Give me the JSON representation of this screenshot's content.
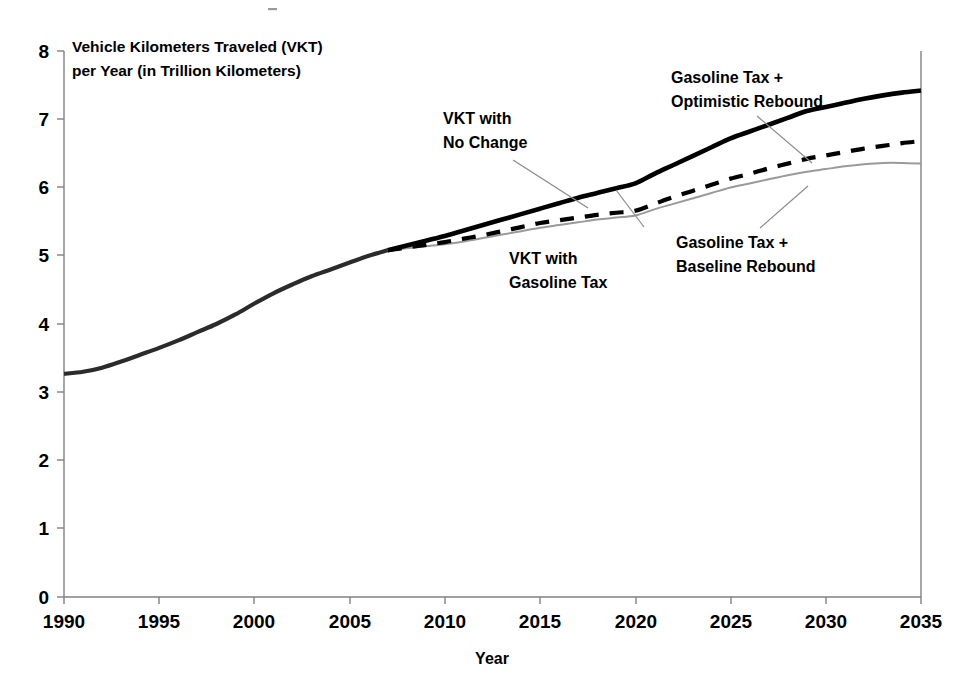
{
  "chart_data": {
    "type": "line",
    "title": "",
    "xlabel": "Year",
    "ylabel": "Vehicle Kilometers Traveled (VKT) per Year (in Trillion Kilometers)",
    "ylabel_line1": "Vehicle Kilometers Traveled (VKT)",
    "ylabel_line2": "per Year (in Trillion Kilometers)",
    "xlim": [
      1990,
      2035
    ],
    "ylim": [
      0,
      8
    ],
    "xticks": [
      1990,
      1995,
      2000,
      2005,
      2010,
      2015,
      2020,
      2025,
      2030,
      2035
    ],
    "yticks": [
      0,
      1,
      2,
      3,
      4,
      5,
      6,
      7,
      8
    ],
    "grid": false,
    "legend_position": "annotations-inline",
    "x": [
      1990,
      1991,
      1992,
      1993,
      1994,
      1995,
      1996,
      1997,
      1998,
      1999,
      2000,
      2001,
      2002,
      2003,
      2004,
      2005,
      2006,
      2007,
      2008,
      2009,
      2010,
      2011,
      2012,
      2013,
      2014,
      2015,
      2016,
      2017,
      2018,
      2019,
      2020,
      2021,
      2022,
      2023,
      2024,
      2025,
      2026,
      2027,
      2028,
      2029,
      2030,
      2031,
      2032,
      2033,
      2034,
      2035
    ],
    "series": [
      {
        "name": "VKT with No Change",
        "style": "solid-thick-black",
        "color": "#000000",
        "values": [
          3.27,
          3.3,
          3.36,
          3.45,
          3.55,
          3.65,
          3.76,
          3.88,
          4.0,
          4.14,
          4.3,
          4.45,
          4.58,
          4.7,
          4.8,
          4.9,
          5.0,
          5.08,
          5.15,
          5.22,
          5.29,
          5.37,
          5.45,
          5.53,
          5.61,
          5.69,
          5.77,
          5.85,
          5.92,
          5.99,
          6.06,
          6.2,
          6.33,
          6.46,
          6.59,
          6.72,
          6.82,
          6.92,
          7.02,
          7.12,
          7.18,
          7.24,
          7.3,
          7.35,
          7.39,
          7.42
        ]
      },
      {
        "name": "Gasoline Tax + Optimistic Rebound",
        "style": "dashed-black",
        "color": "#000000",
        "values": [
          3.27,
          3.3,
          3.36,
          3.45,
          3.55,
          3.65,
          3.76,
          3.88,
          4.0,
          4.14,
          4.3,
          4.45,
          4.58,
          4.7,
          4.8,
          4.9,
          5.0,
          5.08,
          5.12,
          5.16,
          5.2,
          5.25,
          5.3,
          5.36,
          5.42,
          5.48,
          5.52,
          5.56,
          5.6,
          5.63,
          5.66,
          5.76,
          5.86,
          5.95,
          6.04,
          6.13,
          6.2,
          6.28,
          6.35,
          6.42,
          6.47,
          6.52,
          6.57,
          6.61,
          6.65,
          6.68
        ]
      },
      {
        "name": "Gasoline Tax + Baseline Rebound",
        "style": "solid-thin-gray",
        "color": "#9a9a9a",
        "values": [
          3.27,
          3.3,
          3.36,
          3.45,
          3.55,
          3.65,
          3.76,
          3.88,
          4.0,
          4.14,
          4.3,
          4.45,
          4.58,
          4.7,
          4.8,
          4.9,
          5.0,
          5.08,
          5.11,
          5.14,
          5.17,
          5.21,
          5.26,
          5.31,
          5.36,
          5.41,
          5.45,
          5.49,
          5.53,
          5.56,
          5.59,
          5.68,
          5.76,
          5.84,
          5.92,
          6.0,
          6.06,
          6.12,
          6.18,
          6.23,
          6.27,
          6.31,
          6.34,
          6.36,
          6.36,
          6.35
        ]
      }
    ],
    "annotations": [
      {
        "id": "vkt-no-change",
        "line1": "VKT with",
        "line2": "No Change",
        "target_series": "VKT with No Change"
      },
      {
        "id": "gasoline-tax-optimistic-rebound",
        "line1": "Gasoline Tax +",
        "line2": "Optimistic Rebound",
        "target_series": "Gasoline Tax + Optimistic Rebound"
      },
      {
        "id": "vkt-with-gasoline-tax",
        "line1": "VKT with",
        "line2": "Gasoline Tax",
        "target_series": "Gasoline Tax + Optimistic Rebound"
      },
      {
        "id": "gasoline-tax-baseline-rebound",
        "line1": "Gasoline Tax +",
        "line2": "Baseline Rebound",
        "target_series": "Gasoline Tax + Baseline Rebound"
      }
    ]
  },
  "axes": {
    "y_tick_labels": [
      "8",
      "7",
      "6",
      "5",
      "4",
      "3",
      "2",
      "1",
      "0"
    ],
    "x_tick_labels": [
      "1990",
      "1995",
      "2000",
      "2005",
      "2010",
      "2015",
      "2020",
      "2025",
      "2030",
      "2035"
    ],
    "x_axis_title": "Year"
  },
  "colors": {
    "no_change": "#000000",
    "optimistic_rebound": "#000000",
    "baseline_rebound": "#9a9a9a",
    "axis": "#808080",
    "leader": "#8a8a8a",
    "background": "#ffffff"
  }
}
